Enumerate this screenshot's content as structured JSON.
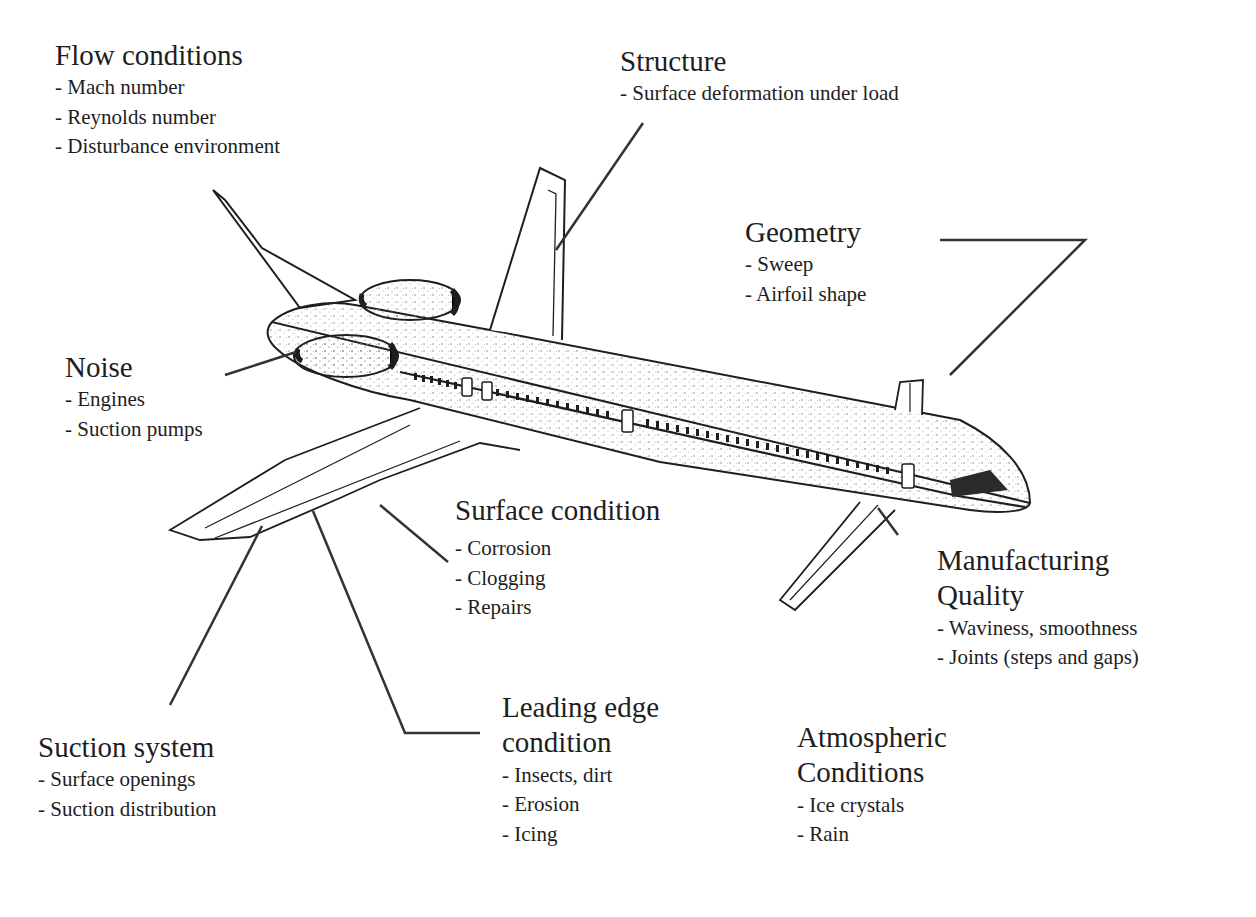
{
  "diagram": {
    "labels": [
      {
        "id": "flow",
        "title": "Flow conditions",
        "items": [
          "- Mach number",
          "- Reynolds number",
          "- Disturbance environment"
        ]
      },
      {
        "id": "structure",
        "title": "Structure",
        "items": [
          "- Surface deformation under load"
        ]
      },
      {
        "id": "geometry",
        "title": "Geometry",
        "items": [
          "- Sweep",
          "- Airfoil shape"
        ]
      },
      {
        "id": "noise",
        "title": "Noise",
        "items": [
          "- Engines",
          "- Suction pumps"
        ]
      },
      {
        "id": "surface",
        "title": "Surface condition",
        "items": [
          "- Corrosion",
          "- Clogging",
          "- Repairs"
        ]
      },
      {
        "id": "manufacturing",
        "title": "Manufacturing\nQuality",
        "items": [
          "- Waviness, smoothness",
          "- Joints (steps and gaps)"
        ]
      },
      {
        "id": "suction",
        "title": "Suction system",
        "items": [
          "- Surface openings",
          "- Suction distribution"
        ]
      },
      {
        "id": "leading",
        "title": "Leading edge\ncondition",
        "items": [
          "- Insects, dirt",
          "- Erosion",
          "- Icing"
        ]
      },
      {
        "id": "atmospheric",
        "title": "Atmospheric\nConditions",
        "items": [
          "- Ice crystals",
          "- Rain"
        ]
      }
    ],
    "colors": {
      "ink": "#1e1e1e",
      "stipple": "#8a8a8a",
      "cockpit": "#2a2a2a",
      "background": "#ffffff"
    }
  }
}
